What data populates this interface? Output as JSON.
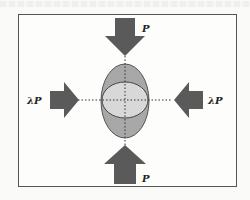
{
  "diagram": {
    "type": "load-diagram",
    "labels": {
      "top": "P",
      "bottom": "P",
      "left": "λP",
      "right": "λP"
    },
    "colors": {
      "arrow": "#5a5a5a",
      "outer_ellipse": "#a9a9a9",
      "inner_ellipse": "#d6d6d6",
      "frame": "#555555",
      "axis": "#333333"
    }
  }
}
